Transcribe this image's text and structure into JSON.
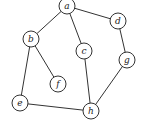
{
  "graph": {
    "node_radius": 8,
    "nodes": [
      {
        "id": "a",
        "label": "a",
        "x": 67,
        "y": 6
      },
      {
        "id": "b",
        "label": "b",
        "x": 31,
        "y": 39
      },
      {
        "id": "c",
        "label": "c",
        "x": 84,
        "y": 51
      },
      {
        "id": "d",
        "label": "d",
        "x": 118,
        "y": 21
      },
      {
        "id": "f",
        "label": "f",
        "x": 58,
        "y": 84
      },
      {
        "id": "g",
        "label": "g",
        "x": 127,
        "y": 60
      },
      {
        "id": "e",
        "label": "e",
        "x": 20,
        "y": 103
      },
      {
        "id": "h",
        "label": "h",
        "x": 91,
        "y": 111
      }
    ],
    "edges": [
      [
        "a",
        "b"
      ],
      [
        "a",
        "c"
      ],
      [
        "a",
        "d"
      ],
      [
        "d",
        "g"
      ],
      [
        "b",
        "f"
      ],
      [
        "b",
        "e"
      ],
      [
        "c",
        "h"
      ],
      [
        "g",
        "h"
      ],
      [
        "e",
        "h"
      ]
    ]
  }
}
